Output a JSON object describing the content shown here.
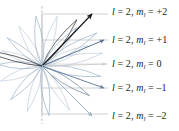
{
  "figure": {
    "background_color": "#ffffff",
    "width": 179,
    "height": 131
  },
  "colors": {
    "axis_gray": "#b7b9bb",
    "gridline_gray": "#c9cbcd",
    "dark_navy": "#16181d",
    "blue_gray": "#5a7391",
    "light_blue": "#8fa7bf",
    "pale_blue": "#b9c6d4",
    "text": "#231f20"
  },
  "axis": {
    "name": "z-axis",
    "x": 42,
    "top_y": 6,
    "bottom_y": 124,
    "origin_x": 42,
    "origin_y": 66
  },
  "labels": [
    {
      "id": "m-plus-2",
      "l_symbol": "l",
      "l_equals": "=",
      "l_value": "2",
      "separator": ",",
      "m_symbol": "m",
      "m_subscript": "l",
      "m_equals": "=",
      "m_value": "+2",
      "text": "l = 2, m_l = +2",
      "x": 112,
      "y": 6
    },
    {
      "id": "m-plus-1",
      "l_symbol": "l",
      "l_equals": "=",
      "l_value": "2",
      "separator": ",",
      "m_symbol": "m",
      "m_subscript": "l",
      "m_equals": "=",
      "m_value": "+1",
      "text": "l = 2, m_l = +1",
      "x": 112,
      "y": 34
    },
    {
      "id": "m-zero",
      "l_symbol": "l",
      "l_equals": "=",
      "l_value": "2",
      "separator": ",",
      "m_symbol": "m",
      "m_subscript": "l",
      "m_equals": "=",
      "m_value": "0",
      "text": "l = 2, m_l = 0",
      "x": 112,
      "y": 58
    },
    {
      "id": "m-minus-1",
      "l_symbol": "l",
      "l_equals": "=",
      "l_value": "2",
      "separator": ",",
      "m_symbol": "m",
      "m_subscript": "l",
      "m_equals": "=",
      "m_value": "–1",
      "text": "l = 2, m_l = -1",
      "x": 112,
      "y": 82
    },
    {
      "id": "m-minus-2",
      "l_symbol": "l",
      "l_equals": "=",
      "l_value": "2",
      "separator": ",",
      "m_symbol": "m",
      "m_subscript": "l",
      "m_equals": "=",
      "m_value": "–2",
      "text": "l = 2, m_l = -2",
      "x": 112,
      "y": 110
    }
  ],
  "chart_data": {
    "type": "scatter",
    "xlabel": "",
    "ylabel": "z-component of angular momentum",
    "grid": true,
    "legend_position": "right",
    "origin": {
      "x": 42,
      "y": 66
    },
    "categories": [
      "+2",
      "+1",
      "0",
      "-1",
      "-2"
    ],
    "values": [
      2,
      1,
      0,
      -1,
      -2
    ],
    "gridlines_y": [
      14,
      40,
      64,
      88,
      114
    ],
    "gridline_x_start": 42,
    "gridline_x_end": 108,
    "vectors": [
      {
        "m_l": 2,
        "label": "l = 2, m_l = +2",
        "tip_x": 92,
        "tip_y": 14,
        "color": "#16181d",
        "width": 1.2
      },
      {
        "m_l": 1,
        "label": "l = 2, m_l = +1",
        "tip_x": 104,
        "tip_y": 40,
        "color": "#5a7391",
        "width": 1.0
      },
      {
        "m_l": 0,
        "label": "l = 2, m_l = 0",
        "tip_x": 106,
        "tip_y": 64,
        "color": "#c9cbcd",
        "width": 0.9
      },
      {
        "m_l": -1,
        "label": "l = 2, m_l = -1",
        "tip_x": 104,
        "tip_y": 88,
        "color": "#6b84a3",
        "width": 1.0
      },
      {
        "m_l": -2,
        "label": "l = 2, m_l = -2",
        "tip_x": 92,
        "tip_y": 116,
        "color": "#9db0c4",
        "width": 1.0
      }
    ],
    "lobes": [
      {
        "angle_deg": -53,
        "length": 58,
        "half_width": 7,
        "color": "#16181d",
        "fill": "none",
        "opacity": 0.95
      },
      {
        "angle_deg": -31,
        "length": 64,
        "half_width": 8,
        "color": "#8fa7bf",
        "fill": "none",
        "opacity": 0.9
      },
      {
        "angle_deg": -12,
        "length": 62,
        "half_width": 9,
        "color": "#b9c6d4",
        "fill": "none",
        "opacity": 0.9
      },
      {
        "angle_deg": 10,
        "length": 60,
        "half_width": 8,
        "color": "#8fa7bf",
        "fill": "none",
        "opacity": 0.9
      },
      {
        "angle_deg": 32,
        "length": 56,
        "half_width": 7,
        "color": "#5a7391",
        "fill": "none",
        "opacity": 0.9
      },
      {
        "angle_deg": 58,
        "length": 52,
        "half_width": 7,
        "color": "#b9c6d4",
        "fill": "none",
        "opacity": 0.9
      },
      {
        "angle_deg": 82,
        "length": 50,
        "half_width": 8,
        "color": "#8fa7bf",
        "fill": "none",
        "opacity": 0.9
      },
      {
        "angle_deg": 108,
        "length": 48,
        "half_width": 7,
        "color": "#b9c6d4",
        "fill": "none",
        "opacity": 0.9
      },
      {
        "angle_deg": 133,
        "length": 46,
        "half_width": 7,
        "color": "#8fa7bf",
        "fill": "none",
        "opacity": 0.9
      },
      {
        "angle_deg": 160,
        "length": 44,
        "half_width": 8,
        "color": "#b9c6d4",
        "fill": "none",
        "opacity": 0.9
      },
      {
        "angle_deg": 182,
        "length": 44,
        "half_width": 7,
        "color": "#8fa7bf",
        "fill": "none",
        "opacity": 0.9
      },
      {
        "angle_deg": 201,
        "length": 43,
        "half_width": 6,
        "color": "#b9c6d4",
        "fill": "none",
        "opacity": 0.85
      },
      {
        "angle_deg": 219,
        "length": 45,
        "half_width": 6,
        "color": "#8fa7bf",
        "fill": "none",
        "opacity": 0.85
      },
      {
        "angle_deg": 240,
        "length": 46,
        "half_width": 7,
        "color": "#b9c6d4",
        "fill": "none",
        "opacity": 0.85
      },
      {
        "angle_deg": 263,
        "length": 50,
        "half_width": 8,
        "color": "#8fa7bf",
        "fill": "none",
        "opacity": 0.9
      },
      {
        "angle_deg": 287,
        "length": 52,
        "half_width": 8,
        "color": "#b9c6d4",
        "fill": "none",
        "opacity": 0.9
      },
      {
        "angle_deg": 312,
        "length": 52,
        "half_width": 7,
        "color": "#8fa7bf",
        "fill": "none",
        "opacity": 0.9
      },
      {
        "angle_deg": 336,
        "length": 50,
        "half_width": 7,
        "color": "#b9c6d4",
        "fill": "none",
        "opacity": 0.9
      },
      {
        "angle_deg": 195,
        "length": 64,
        "half_width": 5,
        "color": "#16181d",
        "fill": "none",
        "opacity": 0.95
      }
    ]
  }
}
